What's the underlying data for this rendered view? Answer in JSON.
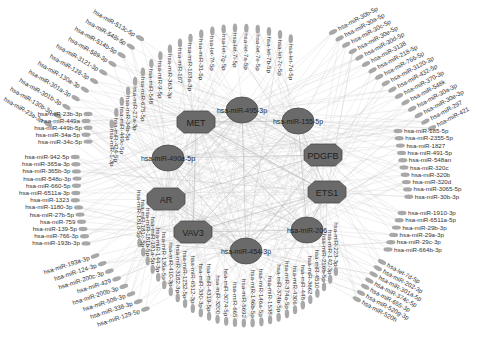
{
  "colors": {
    "background": "#ffffff",
    "hub_fill": "#6a6a6a",
    "hub_stroke": "#4a4a4a",
    "leaf_fill": "#a8a8a8",
    "edge": "#c8c8c8",
    "label": "#333333"
  },
  "hub_genes": [
    {
      "id": "MET",
      "x": 196,
      "y": 122
    },
    {
      "id": "AR",
      "x": 166,
      "y": 199
    },
    {
      "id": "VAV3",
      "x": 193,
      "y": 232
    },
    {
      "id": "PDGFB",
      "x": 323,
      "y": 155
    },
    {
      "id": "ETS1",
      "x": 327,
      "y": 192
    }
  ],
  "hub_mirnas": [
    {
      "id": "hsa-miR-495-3p",
      "x": 242,
      "y": 110
    },
    {
      "id": "hsa-miR-155-5p",
      "x": 298,
      "y": 121
    },
    {
      "id": "hsa-miR-490a-5p",
      "x": 168,
      "y": 158
    },
    {
      "id": "hsa-miR-206",
      "x": 307,
      "y": 230
    },
    {
      "id": "hsa-miR-454-3p",
      "x": 246,
      "y": 251
    }
  ],
  "leaf_groups": {
    "top_left_diag": [
      "hsa-miR-513c-5p",
      "hsa-miR-548i-5p",
      "hsa-miR-514b-5p",
      "hsa-miR-589-3p",
      "hsa-miR-3121-3p",
      "hsa-miR-128-3p",
      "hsa-miR-130a-3p",
      "hsa-miR-301a-3p",
      "hsa-miR-301b-3p",
      "hsa-miR-130b-3p",
      "hsa-miR-23a-3p"
    ],
    "top_arc": [
      "hsa-miR-1-3p",
      "hsa-miR-424-5p",
      "hsa-miR-449c-5p",
      "hsa-miR-34b-5p",
      "hsa-miR-27a-3p",
      "hsa-miR-675-5p",
      "hsa-miR-548",
      "hsa-miR-9-5p",
      "hsa-miR-363-3p",
      "hsa-miR-107",
      "hsa-miR-103a-3p",
      "hsa-miR-31-5p",
      "hsa-let-7f-5p",
      "hsa-let-7g-5p",
      "hsa-let-7i-5p",
      "hsa-let-7a-5p",
      "hsa-let-7e-5p",
      "hsa-let-7b-5p",
      "hsa-let-7c-5p",
      "hsa-let-7d-5p"
    ],
    "top_right_diag": [
      "hsa-miR-30b-5p",
      "hsa-miR-30a-5p",
      "hsa-miR-30c-5p",
      "hsa-miR-30e-5p",
      "hsa-miR-30d-5p",
      "hsa-miR-3138",
      "hsa-miR-218-5p",
      "hsa-miR-766-5p",
      "hsa-miR-3120-3p",
      "hsa-miR-432-5p",
      "hsa-miR-370-3p",
      "hsa-miR-548k",
      "hsa-miR-30a-3p",
      "hsa-miR-30e-3p",
      "hsa-miR-297",
      "hsa-miR-421"
    ],
    "left_col_a": [
      "hsa-miR-23b-3p",
      "hsa-miR-449a",
      "hsa-miR-449b-5p",
      "hsa-miR-34a-5p",
      "hsa-miR-34c-5p"
    ],
    "left_col_b": [
      "hsa-miR-942-5p",
      "hsa-miR-365a-3p",
      "hsa-miR-365b-3p",
      "hsa-miR-548o-3p",
      "hsa-miR-660-5p",
      "hsa-miR-6511a-3p",
      "hsa-miR-1323",
      "hsa-miR-1180-3p",
      "hsa-miR-27b-5p",
      "hsa-miR-759",
      "hsa-miR-139-5p",
      "hsa-miR-766-3p",
      "hsa-miR-193b-3p"
    ],
    "right_col_a": [
      "hsa-miR-185-5p",
      "hsa-miR-2355-5p",
      "hsa-miR-1827",
      "hsa-miR-491-5p",
      "hsa-miR-548an",
      "hsa-miR-320c",
      "hsa-miR-320b",
      "hsa-miR-320d",
      "hsa-miR-3065-5p",
      "hsa-miR-30b-3p"
    ],
    "right_col_b": [
      "hsa-miR-1910-3p",
      "hsa-miR-6511a-5p",
      "hsa-miR-29b-3p",
      "hsa-miR-29a-3p",
      "hsa-miR-29c-3p",
      "hsa-miR-664b-3p"
    ],
    "bottom_left_diag": [
      "hsa-miR-193a-3p",
      "hsa-miR-124-3p",
      "hsa-miR-200c-3p",
      "hsa-miR-429",
      "hsa-miR-200b-3p",
      "hsa-miR-506-3p",
      "hsa-miR-338-3p",
      "hsa-miR-129-5p"
    ],
    "bottom_arc": [
      "hsa-miR-181d-5p",
      "hsa-miR-181c-5p",
      "hsa-miR-181b-5p",
      "hsa-miR-181a-5p",
      "hsa-miR-144-3p",
      "hsa-miR-135a-5p",
      "hsa-miR-410-3p",
      "hsa-miR-3182-3p",
      "hsa-miR-1252-5p",
      "hsa-miR-6512-3p",
      "hsa-miR-330-3p",
      "hsa-miR-4319-5p",
      "hsa-miR-3200",
      "hsa-miR-3074-5p",
      "hsa-miR-665",
      "hsa-miR-5692",
      "hsa-miR-146b-5p",
      "hsa-miR-146a-5p",
      "hsa-miR-1538",
      "hsa-miR-374b-5p",
      "hsa-miR-374a-5p",
      "hsa-miR-4306",
      "hsa-miR-448",
      "hsa-miR-3662",
      "hsa-miR-4510",
      "hsa-miR-216b-5p",
      "hsa-miR-142-3p",
      "hsa-miR-223-3p"
    ],
    "bottom_right_diag": [
      "hsa-let-7d-5p",
      "hsa-miR-202-3p",
      "hsa-miR-301a-5p",
      "hsa-miR-374c-5p",
      "hsa-miR-655-3p",
      "hsa-miR-520g-3p",
      "hsa-miR-520h"
    ]
  }
}
